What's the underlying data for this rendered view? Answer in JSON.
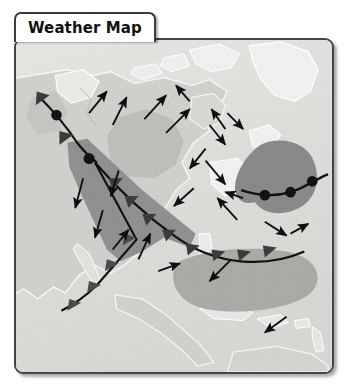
{
  "widget": {
    "name": "weather-map-widget"
  },
  "tab": {
    "title": "Weather Map"
  },
  "map": {
    "background_color": "#dfdfdc",
    "ocean_color": "#d9d9d6",
    "land_color": "#cdcdc9",
    "coast_color": "#f2f2f0",
    "border_color": "#444444",
    "pressure_regions": [
      {
        "name": "region-north-pacific-moderate",
        "color": "#bcbcb8",
        "intensity_label": "moderate"
      },
      {
        "name": "region-continental-central",
        "color": "#b3b3ae",
        "intensity_label": "moderate"
      },
      {
        "name": "region-frontal-band-strong",
        "color": "#909090",
        "intensity_label": "strong"
      },
      {
        "name": "region-north-atlantic-low",
        "color": "#878787",
        "intensity_label": "strong"
      },
      {
        "name": "region-subtropical-atlantic",
        "color": "#a8a8a4",
        "intensity_label": "moderate"
      }
    ],
    "fronts": [
      {
        "name": "occluded-front-northwest",
        "type": "occluded",
        "symbol_color": "#111111",
        "symbols": [
          "triangle",
          "semicircle",
          "triangle",
          "semicircle"
        ]
      },
      {
        "name": "cold-front-main",
        "type": "cold",
        "symbol_color": "#111111",
        "symbols": [
          "triangle"
        ]
      },
      {
        "name": "warm-front-atlantic",
        "type": "warm",
        "symbol_color": "#111111",
        "symbols": [
          "semicircle"
        ]
      }
    ],
    "wind_arrows": [
      {
        "name": "wind-arrow-1",
        "direction_deg": 35
      },
      {
        "name": "wind-arrow-2",
        "direction_deg": 30
      },
      {
        "name": "wind-arrow-3",
        "direction_deg": 40
      },
      {
        "name": "wind-arrow-4",
        "direction_deg": 25
      },
      {
        "name": "wind-arrow-5",
        "direction_deg": 215
      },
      {
        "name": "wind-arrow-6",
        "direction_deg": 200
      },
      {
        "name": "wind-arrow-7",
        "direction_deg": 185
      },
      {
        "name": "wind-arrow-8",
        "direction_deg": 180
      },
      {
        "name": "wind-arrow-9",
        "direction_deg": 150
      },
      {
        "name": "wind-arrow-10",
        "direction_deg": 55
      },
      {
        "name": "wind-arrow-11",
        "direction_deg": 60
      },
      {
        "name": "wind-arrow-12",
        "direction_deg": 20
      },
      {
        "name": "wind-arrow-13",
        "direction_deg": 215
      },
      {
        "name": "wind-arrow-14",
        "direction_deg": 230
      },
      {
        "name": "wind-arrow-15",
        "direction_deg": 45
      },
      {
        "name": "wind-arrow-16",
        "direction_deg": 65
      },
      {
        "name": "wind-arrow-17",
        "direction_deg": 10
      },
      {
        "name": "wind-arrow-18",
        "direction_deg": 205
      },
      {
        "name": "wind-arrow-19",
        "direction_deg": 225
      }
    ]
  }
}
